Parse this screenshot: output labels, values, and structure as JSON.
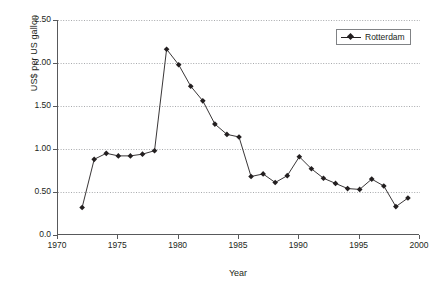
{
  "chart_data": {
    "type": "line",
    "title": "",
    "xlabel": "Year",
    "ylabel": "US$ per US gallon",
    "xlim": [
      1970,
      2000
    ],
    "ylim": [
      0.0,
      2.5
    ],
    "grid": "horizontal-dotted",
    "legend_position": "top-right",
    "x_ticks": [
      "1970",
      "1975",
      "1980",
      "1985",
      "1990",
      "1995",
      "2000"
    ],
    "x_tick_values": [
      1970,
      1975,
      1980,
      1985,
      1990,
      1995,
      2000
    ],
    "y_ticks": [
      "0.0",
      "0.50",
      "1.00",
      "1.50",
      "2.00",
      "2.50"
    ],
    "y_tick_values": [
      0.0,
      0.5,
      1.0,
      1.5,
      2.0,
      2.5
    ],
    "series": [
      {
        "name": "Rotterdam",
        "color": "#231f20",
        "marker": "diamond",
        "x": [
          1972,
          1973,
          1974,
          1975,
          1976,
          1977,
          1978,
          1979,
          1980,
          1981,
          1982,
          1983,
          1984,
          1985,
          1986,
          1987,
          1988,
          1989,
          1990,
          1991,
          1992,
          1993,
          1994,
          1995,
          1996,
          1997,
          1998,
          1999
        ],
        "values": [
          0.32,
          0.88,
          0.95,
          0.92,
          0.92,
          0.94,
          0.98,
          2.16,
          1.98,
          1.73,
          1.56,
          1.29,
          1.17,
          1.14,
          0.68,
          0.71,
          0.61,
          0.69,
          0.91,
          0.77,
          0.66,
          0.6,
          0.54,
          0.53,
          0.65,
          0.57,
          0.33,
          0.43
        ]
      }
    ]
  },
  "legend": {
    "entries": [
      {
        "label": "Rotterdam"
      }
    ]
  },
  "axes": {
    "x_title": "Year",
    "y_title": "US$ per US gallon"
  }
}
